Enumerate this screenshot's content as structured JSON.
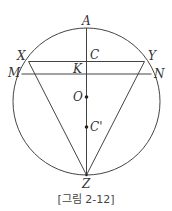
{
  "figure": {
    "caption": "[그림 2-12]",
    "labels": {
      "A": "A",
      "X": "X",
      "Y": "Y",
      "C": "C",
      "K": "K",
      "M": "M",
      "N": "N",
      "O": "O",
      "C_prime": "C'",
      "Z": "Z"
    },
    "circle": {
      "cx": 86.5,
      "cy": 101.5,
      "r": 73.5
    },
    "line_color": "#444444"
  }
}
